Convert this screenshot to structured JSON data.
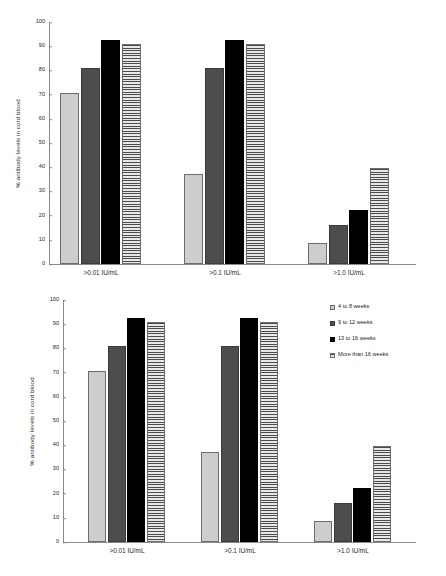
{
  "chart_data": [
    {
      "id": "top",
      "type": "bar",
      "title": "",
      "xlabel": "",
      "ylabel": "% antibody levels in cord blood",
      "ylim": [
        0,
        100
      ],
      "yticks": [
        0,
        10,
        20,
        30,
        40,
        50,
        60,
        70,
        80,
        90,
        100
      ],
      "grid": false,
      "legend_position": "none",
      "categories": [
        ">0.01 IU/mL",
        ">0.1 IU/mL",
        ">1.0 IU/mL"
      ],
      "series": [
        {
          "name": "4 to 8 weeks",
          "pattern": "light-vertical-hatch",
          "values": [
            70.5,
            37,
            8.5
          ]
        },
        {
          "name": "9 to 12 weeks",
          "pattern": "dark-gray-solid",
          "values": [
            81,
            81,
            16
          ]
        },
        {
          "name": "13 to 16 weeks",
          "pattern": "black-solid",
          "values": [
            92.5,
            92.5,
            22.5
          ]
        },
        {
          "name": "More than 16 weeks",
          "pattern": "horizontal-stripes",
          "values": [
            91,
            91,
            39.5
          ]
        }
      ]
    },
    {
      "id": "bottom",
      "type": "bar",
      "title": "",
      "xlabel": "",
      "ylabel": "% antibody levels in cord blood",
      "ylim": [
        0,
        100
      ],
      "yticks": [
        0,
        10,
        20,
        30,
        40,
        50,
        60,
        70,
        80,
        90,
        100
      ],
      "grid": false,
      "legend_position": "right-top",
      "categories": [
        ">0.01 IU/mL",
        ">0.1 IU/mL",
        ">1.0 IU/mL"
      ],
      "series": [
        {
          "name": "4 to 8 weeks",
          "pattern": "light-vertical-hatch",
          "values": [
            70.5,
            37,
            8.5
          ]
        },
        {
          "name": "9 to 12 weeks",
          "pattern": "dark-gray-solid",
          "values": [
            81,
            81,
            16
          ]
        },
        {
          "name": "13 to 16 weeks",
          "pattern": "black-solid",
          "values": [
            92.5,
            92.5,
            22.5
          ]
        },
        {
          "name": "More than 16 weeks",
          "pattern": "horizontal-stripes",
          "values": [
            91,
            91,
            39.5
          ]
        }
      ]
    }
  ],
  "colors": {
    "light": "#cdcdcd",
    "dark_gray": "#4d4d4d",
    "black": "#000000",
    "stripe_base": "#d9d9d9",
    "stripe_line": "#4a4a4a",
    "axis": "#8a8a8a",
    "text": "#231f20",
    "background": "#ffffff"
  },
  "top_chart": {
    "ylabel": "% antibody levels in cord blood",
    "yticks": [
      "100",
      "90",
      "80",
      "70",
      "60",
      "50",
      "40",
      "30",
      "20",
      "10",
      "0"
    ],
    "categories": [
      ">0.01 IU/mL",
      ">0.1 IU/mL",
      ">1.0 IU/mL"
    ]
  },
  "bottom_chart": {
    "ylabel": "% antibody levels in cord blood",
    "yticks": [
      "100",
      "90",
      "80",
      "70",
      "60",
      "50",
      "40",
      "30",
      "20",
      "10",
      "0"
    ],
    "categories": [
      ">0.01 IU/mL",
      ">0.1 IU/mL",
      ">1.0 IU/mL"
    ],
    "legend": {
      "items": [
        {
          "label": "4 to 8 weeks",
          "swatch": "light-vertical-hatch"
        },
        {
          "label": "9 to 12 weeks",
          "swatch": "dark-gray-solid"
        },
        {
          "label": "13 to 16 weeks",
          "swatch": "black-solid"
        },
        {
          "label": "More than 16 weeks",
          "swatch": "horizontal-stripes"
        }
      ]
    }
  }
}
